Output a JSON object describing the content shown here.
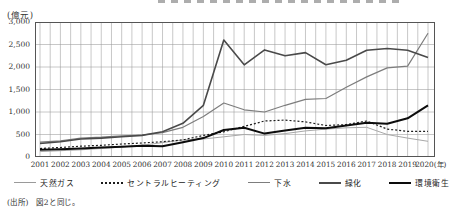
{
  "unit_label": "(億元)",
  "source_note": "(出所)　図2と同じ。",
  "axis": {
    "y_tick_labels": [
      "3,000",
      "2,500",
      "2,000",
      "1,500",
      "1,000",
      "500",
      "0"
    ],
    "x_suffix": "(年)"
  },
  "colors": {
    "grid": "#9a9a9a",
    "frame": "#555555",
    "natural_gas": "#a8a8a8",
    "central_heating": "#1d1d1d",
    "sewage": "#7d7d7d",
    "greening": "#4a4a4a",
    "environmental_sanitation": "#0c0c0c"
  },
  "chart_data": {
    "type": "line",
    "title": "",
    "xlabel": "(年)",
    "ylabel": "(億元)",
    "ylim": [
      0,
      3000
    ],
    "y_tick_step": 500,
    "grid": true,
    "legend_position": "bottom",
    "x": [
      2001,
      2002,
      2003,
      2004,
      2005,
      2006,
      2007,
      2008,
      2009,
      2010,
      2011,
      2012,
      2013,
      2014,
      2015,
      2016,
      2017,
      2018,
      2019,
      2020
    ],
    "series": [
      {
        "name": "天然ガス",
        "style": "thin-gray",
        "color": "#a8a8a8",
        "width": 1,
        "values": [
          120,
          140,
          160,
          190,
          220,
          260,
          320,
          380,
          400,
          450,
          500,
          480,
          520,
          580,
          620,
          650,
          660,
          500,
          420,
          350
        ]
      },
      {
        "name": "セントラルヒーティング",
        "style": "dotted",
        "color": "#1d1d1d",
        "width": 1.2,
        "values": [
          190,
          210,
          240,
          260,
          290,
          310,
          340,
          380,
          480,
          560,
          680,
          800,
          820,
          780,
          700,
          720,
          800,
          620,
          570,
          570
        ]
      },
      {
        "name": "下水",
        "style": "gray",
        "color": "#7d7d7d",
        "width": 1.2,
        "values": [
          330,
          360,
          420,
          440,
          470,
          490,
          540,
          660,
          900,
          1200,
          1050,
          1000,
          1150,
          1280,
          1300,
          1550,
          1780,
          1980,
          2020,
          2750
        ]
      },
      {
        "name": "緑化",
        "style": "dark",
        "color": "#4a4a4a",
        "width": 1.6,
        "values": [
          300,
          340,
          400,
          420,
          450,
          480,
          560,
          750,
          1150,
          2600,
          2050,
          2380,
          2250,
          2320,
          2050,
          2150,
          2370,
          2410,
          2370,
          2210
        ]
      },
      {
        "name": "環境衛生",
        "style": "thick-black",
        "color": "#0c0c0c",
        "width": 2,
        "values": [
          160,
          170,
          190,
          210,
          230,
          250,
          240,
          330,
          420,
          600,
          650,
          520,
          590,
          650,
          640,
          700,
          760,
          740,
          860,
          1150
        ]
      }
    ]
  }
}
